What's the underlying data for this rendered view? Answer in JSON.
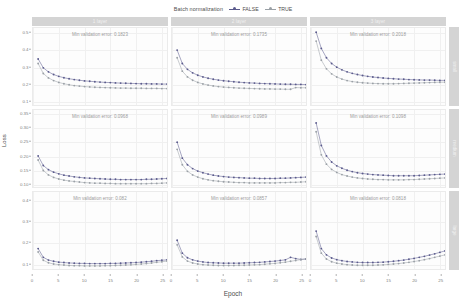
{
  "legend": {
    "title": "Batch normalization",
    "entries": [
      {
        "label": "FALSE",
        "color": "#5a5a8c"
      },
      {
        "label": "TRUE",
        "color": "#9aa0a6"
      }
    ]
  },
  "axes": {
    "xlabel": "Epoch",
    "ylabel": "Loss",
    "xticks": [
      "0",
      "5",
      "10",
      "15",
      "20",
      "25"
    ],
    "xlim": [
      0,
      26
    ],
    "row_yticks": [
      [
        "0.1",
        "0.2",
        "0.3",
        "0.4",
        "0.5"
      ],
      [
        "0.10",
        "0.15",
        "0.20",
        "0.25",
        "0.30",
        "0.35"
      ],
      [
        "0.1",
        "0.2",
        "0.3",
        "0.4"
      ]
    ],
    "row_ylim": [
      [
        0.07,
        0.53
      ],
      [
        0.085,
        0.365
      ],
      [
        0.07,
        0.44
      ]
    ]
  },
  "col_strips": [
    "1 layer",
    "2 layer",
    "3 layer"
  ],
  "row_strips": [
    "small",
    "medium",
    "large"
  ],
  "chart_data": {
    "type": "line",
    "title": "",
    "xlabel": "Epoch",
    "ylabel": "Loss",
    "facet_cols": [
      "1 layer",
      "2 layer",
      "3 layer"
    ],
    "facet_rows": [
      "small",
      "medium",
      "large"
    ],
    "legend_title": "Batch normalization",
    "legend_position": "top",
    "grid": true,
    "x": [
      1,
      2,
      3,
      4,
      5,
      6,
      7,
      8,
      9,
      10,
      11,
      12,
      13,
      14,
      15,
      16,
      17,
      18,
      19,
      20,
      21,
      22,
      23,
      24,
      25,
      26
    ],
    "panels": [
      {
        "row": "small",
        "col": "1 layer",
        "annotation": "Min validation error: 0.1823",
        "ylim": [
          0.07,
          0.53
        ],
        "series": [
          {
            "name": "FALSE",
            "values": [
              0.345,
              0.292,
              0.268,
              0.252,
              0.241,
              0.233,
              0.227,
              0.222,
              0.218,
              0.214,
              0.212,
              0.209,
              0.207,
              0.205,
              0.204,
              0.202,
              0.201,
              0.2,
              0.199,
              0.198,
              0.197,
              0.197,
              0.196,
              0.196,
              0.195,
              0.195
            ]
          },
          {
            "name": "TRUE",
            "values": [
              0.318,
              0.258,
              0.232,
              0.216,
              0.205,
              0.197,
              0.191,
              0.186,
              0.183,
              0.18,
              0.178,
              0.176,
              0.175,
              0.174,
              0.173,
              0.172,
              0.171,
              0.171,
              0.17,
              0.17,
              0.17,
              0.169,
              0.169,
              0.169,
              0.168,
              0.168
            ]
          }
        ]
      },
      {
        "row": "small",
        "col": "2 layer",
        "annotation": "Min validation error: 0.1735",
        "ylim": [
          0.07,
          0.53
        ],
        "series": [
          {
            "name": "FALSE",
            "values": [
              0.398,
              0.318,
              0.283,
              0.262,
              0.248,
              0.238,
              0.23,
              0.224,
              0.219,
              0.215,
              0.212,
              0.209,
              0.206,
              0.204,
              0.202,
              0.201,
              0.199,
              0.198,
              0.197,
              0.196,
              0.195,
              0.194,
              0.194,
              0.193,
              0.193,
              0.192
            ]
          },
          {
            "name": "TRUE",
            "values": [
              0.352,
              0.272,
              0.238,
              0.218,
              0.205,
              0.196,
              0.189,
              0.184,
              0.18,
              0.177,
              0.175,
              0.173,
              0.171,
              0.17,
              0.169,
              0.168,
              0.167,
              0.166,
              0.166,
              0.165,
              0.165,
              0.164,
              0.164,
              0.174,
              0.173,
              0.173
            ]
          }
        ]
      },
      {
        "row": "small",
        "col": "3 layer",
        "annotation": "Min validation error: 0.2018",
        "ylim": [
          0.07,
          0.53
        ],
        "series": [
          {
            "name": "FALSE",
            "values": [
              0.505,
              0.408,
              0.352,
              0.318,
              0.296,
              0.28,
              0.268,
              0.259,
              0.252,
              0.246,
              0.241,
              0.237,
              0.234,
              0.231,
              0.229,
              0.227,
              0.225,
              0.224,
              0.222,
              0.221,
              0.22,
              0.219,
              0.219,
              0.218,
              0.217,
              0.217
            ]
          },
          {
            "name": "TRUE",
            "values": [
              0.452,
              0.338,
              0.286,
              0.256,
              0.237,
              0.225,
              0.216,
              0.21,
              0.206,
              0.203,
              0.201,
              0.199,
              0.198,
              0.197,
              0.197,
              0.197,
              0.198,
              0.199,
              0.2,
              0.201,
              0.202,
              0.203,
              0.204,
              0.205,
              0.206,
              0.206
            ]
          }
        ]
      },
      {
        "row": "medium",
        "col": "1 layer",
        "annotation": "Min validation error: 0.0968",
        "ylim": [
          0.085,
          0.365
        ],
        "series": [
          {
            "name": "FALSE",
            "values": [
              0.198,
              0.163,
              0.148,
              0.139,
              0.133,
              0.128,
              0.125,
              0.122,
              0.12,
              0.118,
              0.117,
              0.116,
              0.115,
              0.114,
              0.113,
              0.113,
              0.112,
              0.112,
              0.112,
              0.112,
              0.112,
              0.113,
              0.113,
              0.114,
              0.115,
              0.116
            ]
          },
          {
            "name": "TRUE",
            "values": [
              0.183,
              0.145,
              0.129,
              0.12,
              0.114,
              0.11,
              0.107,
              0.105,
              0.103,
              0.101,
              0.1,
              0.099,
              0.099,
              0.098,
              0.098,
              0.097,
              0.097,
              0.097,
              0.097,
              0.097,
              0.097,
              0.097,
              0.098,
              0.098,
              0.099,
              0.1
            ]
          }
        ]
      },
      {
        "row": "medium",
        "col": "2 layer",
        "annotation": "Min validation error: 0.0989",
        "ylim": [
          0.085,
          0.365
        ],
        "series": [
          {
            "name": "FALSE",
            "values": [
              0.248,
              0.19,
              0.166,
              0.152,
              0.143,
              0.137,
              0.132,
              0.128,
              0.125,
              0.123,
              0.121,
              0.12,
              0.119,
              0.118,
              0.117,
              0.117,
              0.116,
              0.116,
              0.116,
              0.116,
              0.117,
              0.117,
              0.118,
              0.119,
              0.12,
              0.121
            ]
          },
          {
            "name": "TRUE",
            "values": [
              0.222,
              0.166,
              0.142,
              0.129,
              0.121,
              0.115,
              0.111,
              0.108,
              0.106,
              0.104,
              0.103,
              0.102,
              0.101,
              0.101,
              0.1,
              0.1,
              0.1,
              0.1,
              0.1,
              0.1,
              0.101,
              0.101,
              0.102,
              0.102,
              0.103,
              0.104
            ]
          }
        ]
      },
      {
        "row": "medium",
        "col": "3 layer",
        "annotation": "Min validation error: 0.1098",
        "ylim": [
          0.085,
          0.365
        ],
        "series": [
          {
            "name": "FALSE",
            "values": [
              0.318,
              0.236,
              0.198,
              0.176,
              0.162,
              0.153,
              0.146,
              0.141,
              0.137,
              0.134,
              0.132,
              0.13,
              0.129,
              0.128,
              0.127,
              0.126,
              0.126,
              0.126,
              0.126,
              0.126,
              0.127,
              0.128,
              0.129,
              0.13,
              0.131,
              0.132
            ]
          },
          {
            "name": "TRUE",
            "values": [
              0.286,
              0.202,
              0.168,
              0.149,
              0.138,
              0.13,
              0.125,
              0.121,
              0.118,
              0.116,
              0.114,
              0.113,
              0.112,
              0.112,
              0.111,
              0.111,
              0.111,
              0.111,
              0.112,
              0.112,
              0.113,
              0.114,
              0.115,
              0.116,
              0.117,
              0.118
            ]
          }
        ]
      },
      {
        "row": "large",
        "col": "1 layer",
        "annotation": "Min validation error: 0.082",
        "ylim": [
          0.07,
          0.44
        ],
        "series": [
          {
            "name": "FALSE",
            "values": [
              0.168,
              0.126,
              0.113,
              0.107,
              0.103,
              0.101,
              0.099,
              0.098,
              0.097,
              0.097,
              0.096,
              0.096,
              0.096,
              0.096,
              0.097,
              0.097,
              0.098,
              0.099,
              0.1,
              0.101,
              0.103,
              0.105,
              0.107,
              0.11,
              0.112,
              0.114
            ]
          },
          {
            "name": "TRUE",
            "values": [
              0.152,
              0.112,
              0.1,
              0.094,
              0.091,
              0.089,
              0.087,
              0.086,
              0.086,
              0.085,
              0.085,
              0.085,
              0.085,
              0.086,
              0.086,
              0.087,
              0.088,
              0.089,
              0.09,
              0.092,
              0.094,
              0.096,
              0.099,
              0.102,
              0.105,
              0.108
            ]
          }
        ]
      },
      {
        "row": "large",
        "col": "2 layer",
        "annotation": "Min validation error: 0.0857",
        "ylim": [
          0.07,
          0.44
        ],
        "series": [
          {
            "name": "FALSE",
            "values": [
              0.208,
              0.146,
              0.124,
              0.114,
              0.108,
              0.104,
              0.101,
              0.1,
              0.099,
              0.098,
              0.098,
              0.098,
              0.098,
              0.099,
              0.1,
              0.101,
              0.102,
              0.104,
              0.106,
              0.108,
              0.111,
              0.114,
              0.126,
              0.12,
              0.116,
              0.118
            ]
          },
          {
            "name": "TRUE",
            "values": [
              0.186,
              0.128,
              0.108,
              0.099,
              0.094,
              0.091,
              0.089,
              0.088,
              0.087,
              0.087,
              0.087,
              0.087,
              0.088,
              0.088,
              0.089,
              0.09,
              0.091,
              0.093,
              0.095,
              0.097,
              0.1,
              0.103,
              0.107,
              0.111,
              0.115,
              0.119
            ]
          }
        ]
      },
      {
        "row": "large",
        "col": "3 layer",
        "annotation": "Min validation error: 0.0818",
        "ylim": [
          0.07,
          0.44
        ],
        "series": [
          {
            "name": "FALSE",
            "values": [
              0.252,
              0.168,
              0.138,
              0.123,
              0.115,
              0.11,
              0.106,
              0.104,
              0.102,
              0.101,
              0.101,
              0.101,
              0.102,
              0.103,
              0.105,
              0.107,
              0.11,
              0.113,
              0.117,
              0.121,
              0.126,
              0.131,
              0.137,
              0.143,
              0.15,
              0.157
            ]
          },
          {
            "name": "TRUE",
            "values": [
              0.226,
              0.146,
              0.118,
              0.105,
              0.098,
              0.094,
              0.091,
              0.089,
              0.088,
              0.088,
              0.088,
              0.088,
              0.089,
              0.09,
              0.092,
              0.094,
              0.096,
              0.099,
              0.102,
              0.106,
              0.11,
              0.115,
              0.12,
              0.126,
              0.132,
              0.138
            ]
          }
        ]
      }
    ]
  }
}
